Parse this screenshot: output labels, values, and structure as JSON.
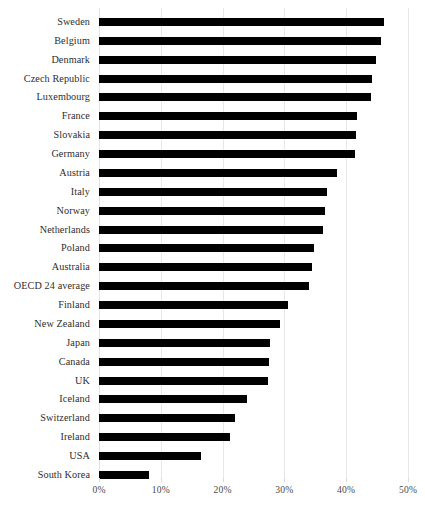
{
  "chart_data": {
    "type": "bar",
    "orientation": "horizontal",
    "title": "",
    "subtitle": "",
    "xlabel": "",
    "ylabel": "",
    "xlim": [
      0,
      50
    ],
    "xtick_values": [
      0,
      10,
      20,
      30,
      40,
      50
    ],
    "xtick_labels": [
      "0%",
      "10%",
      "20%",
      "30%",
      "40%",
      "50%"
    ],
    "grid": "vertical",
    "legend": "none",
    "bar_color": "#000000",
    "gridline_color": "#e8e8e8",
    "label_color": "#2e2e2e",
    "tick_label_color": "#4a4a4a",
    "categories": [
      "Sweden",
      "Belgium",
      "Denmark",
      "Czech Republic",
      "Luxembourg",
      "France",
      "Slovakia",
      "Germany",
      "Austria",
      "Italy",
      "Norway",
      "Netherlands",
      "Poland",
      "Australia",
      "OECD 24 average",
      "Finland",
      "New Zealand",
      "Japan",
      "Canada",
      "UK",
      "Iceland",
      "Switzerland",
      "Ireland",
      "USA",
      "South Korea"
    ],
    "values": [
      46.1,
      45.6,
      44.8,
      44.2,
      44.0,
      41.7,
      41.6,
      41.4,
      38.5,
      36.9,
      36.6,
      36.2,
      34.8,
      34.5,
      34.0,
      30.6,
      29.3,
      27.7,
      27.5,
      27.3,
      23.9,
      22.0,
      21.2,
      16.5,
      8.1
    ],
    "value_labels": [
      "46.1%",
      "45.6%",
      "44.8%",
      "44.2%",
      "44.0%",
      "41.7%",
      "41.6%",
      "41.4%",
      "38.5%",
      "36.9%",
      "36.6%",
      "36.2%",
      "34.8%",
      "34.5%",
      "34.0%",
      "30.6%",
      "29.3%",
      "27.7%",
      "27.5%",
      "27.3%",
      "23.9%",
      "22.0%",
      "21.2%",
      "16.5%",
      "8.1%"
    ]
  }
}
